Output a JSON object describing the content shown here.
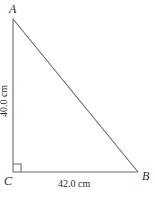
{
  "figure": {
    "type": "right-triangle-diagram",
    "width": 155,
    "height": 198,
    "background_color": "#ffffff",
    "stroke_color": "#6a6a6a",
    "stroke_width": 1,
    "text_color": "#2b2b2b"
  },
  "vertices": {
    "a": {
      "label": "A",
      "x": 13,
      "y": 19
    },
    "c": {
      "label": "C",
      "x": 13,
      "y": 172
    },
    "b": {
      "label": "B",
      "x": 138,
      "y": 172
    }
  },
  "right_angle": {
    "at_vertex": "C",
    "marker_size": 8,
    "marker_name": "right-angle-marker"
  },
  "measurements": {
    "leg_ac": "40.0 cm",
    "leg_cb": "42.0 cm"
  }
}
